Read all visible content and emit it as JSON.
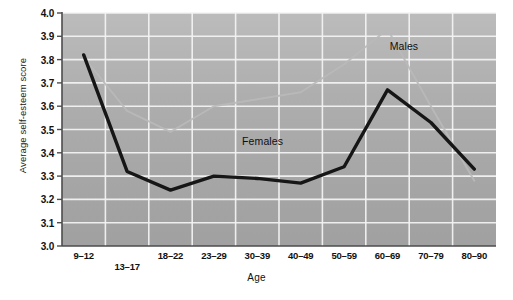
{
  "chart_data": {
    "type": "line",
    "title": "",
    "xlabel": "Age",
    "ylabel": "Average self-esteem score",
    "categories": [
      "9–12",
      "13–17",
      "18–22",
      "23–29",
      "30–39",
      "40–49",
      "50–59",
      "60–69",
      "70–79",
      "80–90"
    ],
    "ylim": [
      3.0,
      4.0
    ],
    "ytick_labels": [
      "3.0",
      "3.1",
      "3.2",
      "3.3",
      "3.4",
      "3.5",
      "3.6",
      "3.7",
      "3.8",
      "3.9",
      "4.0"
    ],
    "ytick_values": [
      3.0,
      3.1,
      3.2,
      3.3,
      3.4,
      3.5,
      3.6,
      3.7,
      3.8,
      3.9,
      4.0
    ],
    "grid": true,
    "legend_position": "inline-annotations",
    "series": [
      {
        "name": "Males",
        "color": "#b9b9b9",
        "values": [
          3.81,
          3.58,
          3.49,
          3.6,
          3.63,
          3.66,
          3.78,
          3.93,
          3.6,
          3.28
        ]
      },
      {
        "name": "Females",
        "color": "#161616",
        "values": [
          3.82,
          3.32,
          3.24,
          3.3,
          3.29,
          3.27,
          3.34,
          3.67,
          3.53,
          3.33
        ]
      }
    ],
    "annotations": [
      {
        "text": "Males",
        "x_frac": 0.755,
        "y_value": 3.855
      },
      {
        "text": "Females",
        "x_frac": 0.415,
        "y_value": 3.445
      }
    ],
    "plot_background": "#a9a9a9",
    "gridline_color": "#f2f2f2",
    "axis_color": "#4d4d4d",
    "figure_background": "#ffffff"
  }
}
